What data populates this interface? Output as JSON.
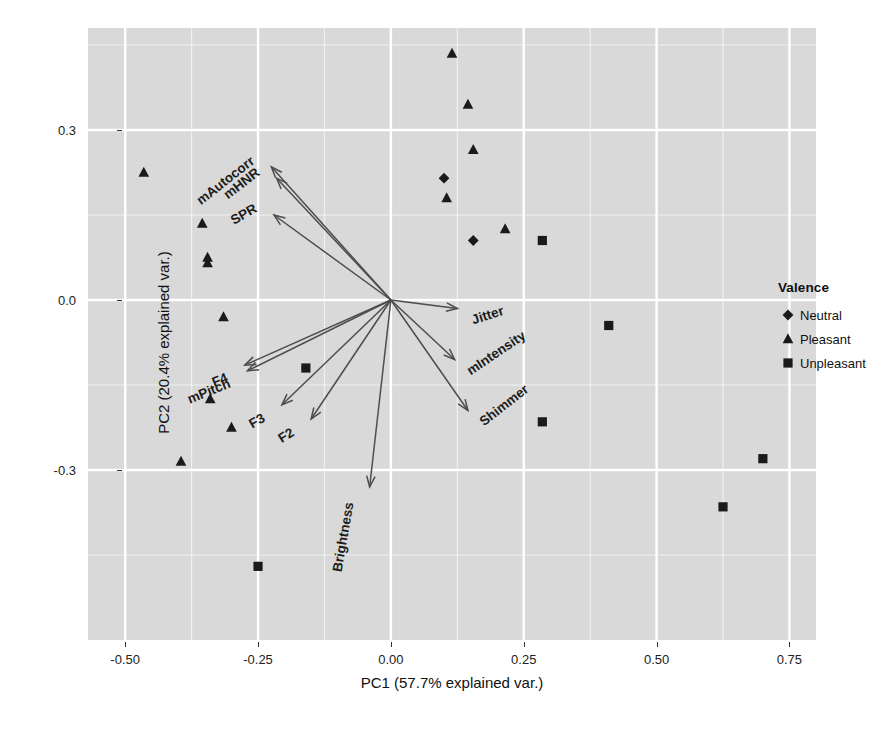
{
  "axes": {
    "xlabel": "PC1 (57.7% explained var.)",
    "ylabel": "PC2 (20.4% explained var.)",
    "xticks": [
      "-0.50",
      "-0.25",
      "0.00",
      "0.25",
      "0.50",
      "0.75"
    ],
    "yticks": [
      "0.3",
      "0.0",
      "-0.3"
    ]
  },
  "legend": {
    "title": "Valence",
    "items": [
      {
        "label": "Neutral",
        "marker": "diamond-marker"
      },
      {
        "label": "Pleasant",
        "marker": "triangle-marker"
      },
      {
        "label": "Unpleasant",
        "marker": "square-marker"
      }
    ]
  },
  "chart_data": {
    "type": "scatter",
    "title": "",
    "subtitle": "",
    "xlabel": "PC1 (57.7% explained var.)",
    "ylabel": "PC2 (20.4% explained var.)",
    "xlim": [
      -0.57,
      0.8
    ],
    "ylim": [
      -0.6,
      0.48
    ],
    "xtick_values": [
      -0.5,
      -0.25,
      0.0,
      0.25,
      0.5,
      0.75
    ],
    "ytick_values": [
      0.3,
      0.0,
      -0.3
    ],
    "grid": true,
    "panel_background": "#d9d9d9",
    "grid_color": "#ffffff",
    "marker_color": "#1a1a1a",
    "arrow_color": "#4d4d4d",
    "legend_position": "right",
    "legend_title": "Valence",
    "series": [
      {
        "name": "Neutral",
        "marker": "diamond",
        "points": [
          {
            "x": 0.1,
            "y": 0.215
          },
          {
            "x": 0.155,
            "y": 0.105
          }
        ]
      },
      {
        "name": "Pleasant",
        "marker": "triangle",
        "points": [
          {
            "x": 0.115,
            "y": 0.435
          },
          {
            "x": 0.145,
            "y": 0.345
          },
          {
            "x": 0.155,
            "y": 0.265
          },
          {
            "x": 0.105,
            "y": 0.18
          },
          {
            "x": 0.215,
            "y": 0.125
          },
          {
            "x": -0.465,
            "y": 0.225
          },
          {
            "x": -0.355,
            "y": 0.135
          },
          {
            "x": -0.345,
            "y": 0.075
          },
          {
            "x": -0.345,
            "y": 0.065
          },
          {
            "x": -0.315,
            "y": -0.03
          },
          {
            "x": -0.34,
            "y": -0.175
          },
          {
            "x": -0.3,
            "y": -0.225
          },
          {
            "x": -0.395,
            "y": -0.285
          }
        ]
      },
      {
        "name": "Unpleasant",
        "marker": "square",
        "points": [
          {
            "x": 0.285,
            "y": 0.105
          },
          {
            "x": 0.41,
            "y": -0.045
          },
          {
            "x": 0.285,
            "y": -0.215
          },
          {
            "x": 0.7,
            "y": -0.28
          },
          {
            "x": 0.625,
            "y": -0.365
          },
          {
            "x": -0.16,
            "y": -0.12
          },
          {
            "x": -0.25,
            "y": -0.47
          }
        ]
      }
    ],
    "loading_vectors": [
      {
        "label": "mAutocorr",
        "x": -0.225,
        "y": 0.235,
        "label_angle": -38
      },
      {
        "label": "mHNR",
        "x": -0.215,
        "y": 0.215,
        "label_angle": -38
      },
      {
        "label": "SPR",
        "x": -0.22,
        "y": 0.15,
        "label_angle": -30
      },
      {
        "label": "F4",
        "x": -0.275,
        "y": -0.115,
        "label_angle": -22
      },
      {
        "label": "mPitch",
        "x": -0.27,
        "y": -0.125,
        "label_angle": -22
      },
      {
        "label": "F3",
        "x": -0.205,
        "y": -0.185,
        "label_angle": -30
      },
      {
        "label": "F2",
        "x": -0.15,
        "y": -0.21,
        "label_angle": -32
      },
      {
        "label": "Brightness",
        "x": -0.04,
        "y": -0.33,
        "label_angle": -80
      },
      {
        "label": "Jitter",
        "x": 0.125,
        "y": -0.015,
        "label_angle": -18
      },
      {
        "label": "mIntensity",
        "x": 0.12,
        "y": -0.105,
        "label_angle": -34
      },
      {
        "label": "Shimmer",
        "x": 0.145,
        "y": -0.195,
        "label_angle": -38
      }
    ]
  }
}
